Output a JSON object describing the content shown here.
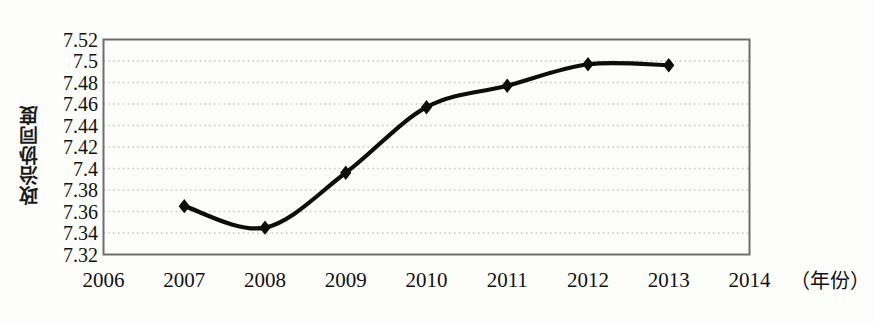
{
  "chart_data": {
    "type": "line",
    "title": "",
    "xlabel": "（年份）",
    "ylabel": "政治协同度",
    "x": [
      2007,
      2008,
      2009,
      2010,
      2011,
      2012,
      2013
    ],
    "values": [
      7.365,
      7.345,
      7.396,
      7.457,
      7.477,
      7.497,
      7.496
    ],
    "series": [
      {
        "name": "政治协同度",
        "values": [
          7.365,
          7.345,
          7.396,
          7.457,
          7.477,
          7.497,
          7.496
        ]
      }
    ],
    "x_tick_labels": [
      "2006",
      "2007",
      "2008",
      "2009",
      "2010",
      "2011",
      "2012",
      "2013",
      "2014"
    ],
    "x_tick_values": [
      2006,
      2007,
      2008,
      2009,
      2010,
      2011,
      2012,
      2013,
      2014
    ],
    "y_tick_labels": [
      "7.32",
      "7.34",
      "7.36",
      "7.38",
      "7.4",
      "7.42",
      "7.44",
      "7.46",
      "7.48",
      "7.5",
      "7.52"
    ],
    "y_tick_values": [
      7.32,
      7.34,
      7.36,
      7.38,
      7.4,
      7.42,
      7.44,
      7.46,
      7.48,
      7.5,
      7.52
    ],
    "xlim": [
      2006,
      2014
    ],
    "ylim": [
      7.32,
      7.52
    ],
    "grid": "horizontal-dotted",
    "legend": "none",
    "marker": "diamond",
    "line_color": "#0d0d0d",
    "marker_color": "#0d0d0d",
    "gridline_color": "#c9c9c9",
    "axis_color": "#6e6e6e",
    "background_color": "#fdfdfc"
  }
}
